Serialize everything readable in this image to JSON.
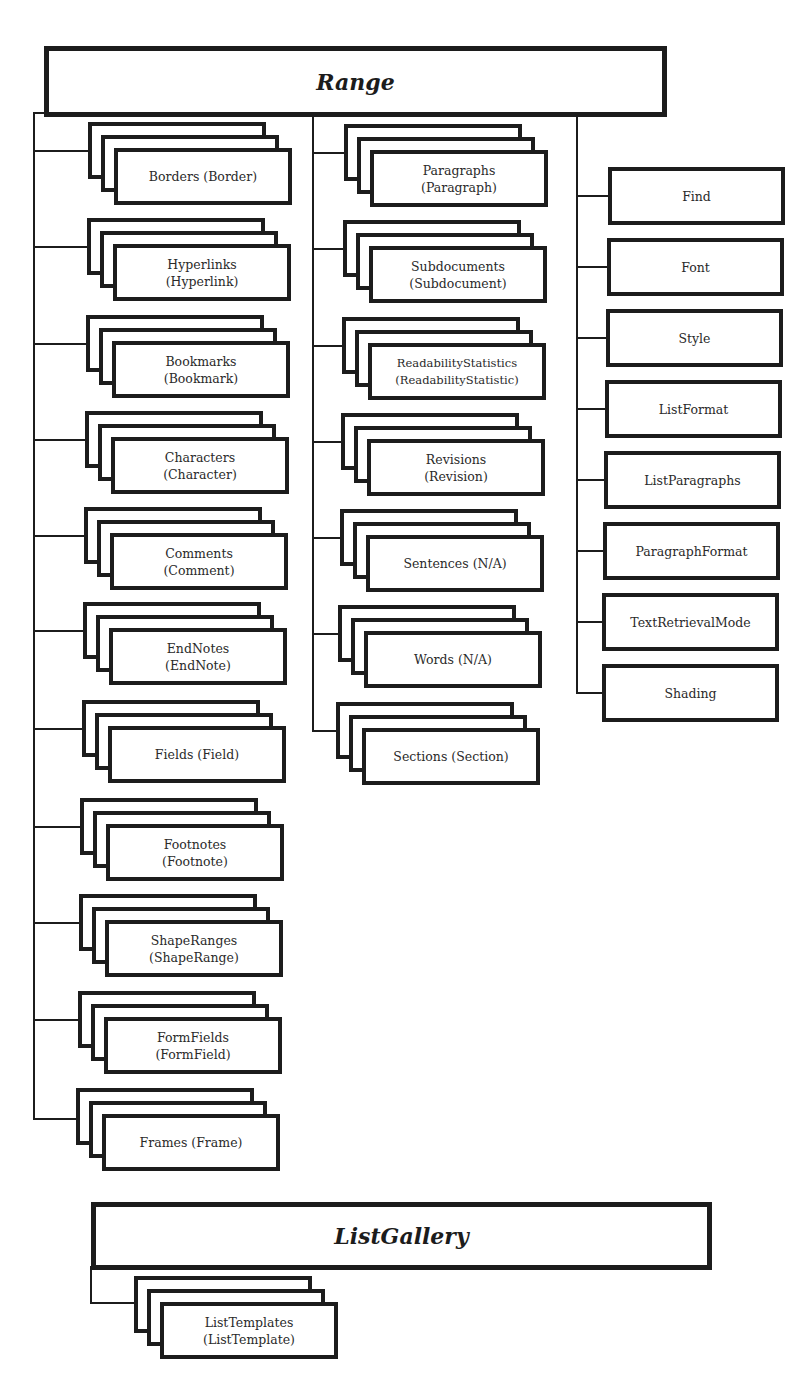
{
  "diagram": {
    "type": "object-model-hierarchy",
    "range": {
      "title": "Range",
      "collections_left": [
        {
          "label": "Borders (Border)"
        },
        {
          "label": "Hyperlinks\n(Hyperlink)"
        },
        {
          "label": "Bookmarks\n(Bookmark)"
        },
        {
          "label": "Characters\n(Character)"
        },
        {
          "label": "Comments\n(Comment)"
        },
        {
          "label": "EndNotes\n(EndNote)"
        },
        {
          "label": "Fields (Field)"
        },
        {
          "label": "Footnotes\n(Footnote)"
        },
        {
          "label": "ShapeRanges\n(ShapeRange)"
        },
        {
          "label": "FormFields\n(FormField)"
        },
        {
          "label": "Frames (Frame)"
        }
      ],
      "collections_middle": [
        {
          "label": "Paragraphs\n(Paragraph)"
        },
        {
          "label": "Subdocuments\n(Subdocument)"
        },
        {
          "label": "ReadabilityStatistics\n(ReadabilityStatistic)"
        },
        {
          "label": "Revisions\n(Revision)"
        },
        {
          "label": "Sentences (N/A)"
        },
        {
          "label": "Words (N/A)"
        },
        {
          "label": "Sections (Section)"
        }
      ],
      "objects_right": [
        {
          "label": "Find"
        },
        {
          "label": "Font"
        },
        {
          "label": "Style"
        },
        {
          "label": "ListFormat"
        },
        {
          "label": "ListParagraphs"
        },
        {
          "label": "ParagraphFormat"
        },
        {
          "label": "TextRetrievalMode"
        },
        {
          "label": "Shading"
        }
      ]
    },
    "list_gallery": {
      "title": "ListGallery",
      "collections": [
        {
          "label": "ListTemplates\n(ListTemplate)"
        }
      ]
    },
    "legend_hint": {
      "stacked_box": "collection (object)",
      "single_box": "object"
    },
    "colors": {
      "line": "#1c1c1c",
      "text": "#2a2a2a",
      "background": "#ffffff"
    }
  }
}
